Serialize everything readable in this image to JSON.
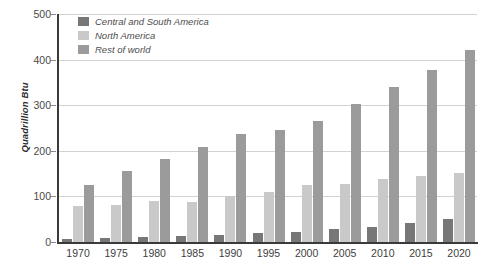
{
  "chart_data": {
    "type": "bar",
    "title": "",
    "subtitle": "",
    "xlabel": "",
    "ylabel": "Quadrillion Btu",
    "categories": [
      "1970",
      "1975",
      "1980",
      "1985",
      "1990",
      "1995",
      "2000",
      "2005",
      "2010",
      "2015",
      "2020"
    ],
    "series": [
      {
        "name": "Central and South America",
        "color": "#777777",
        "values": [
          7,
          8,
          12,
          14,
          16,
          19,
          23,
          28,
          33,
          42,
          50
        ]
      },
      {
        "name": "North America",
        "color": "#c9c9c9",
        "values": [
          78,
          81,
          89,
          88,
          101,
          110,
          126,
          128,
          139,
          145,
          152
        ]
      },
      {
        "name": "Rest of world",
        "color": "#9b9b9b",
        "values": [
          124,
          155,
          183,
          208,
          236,
          245,
          265,
          303,
          341,
          378,
          420
        ]
      }
    ],
    "ylim": [
      0,
      500
    ],
    "yticks": [
      0,
      100,
      200,
      300,
      400,
      500
    ],
    "ytick_labels": [
      "0",
      "100",
      "200",
      "300",
      "400",
      "500"
    ],
    "grid": true,
    "grid_axis": "y",
    "legend_position": "top-left",
    "bar_orientation": "vertical",
    "background_color": "#ffffff",
    "axis_color": "#3a3a3a",
    "gridline_color": "#d2d2d2"
  },
  "legend": {
    "items": [
      {
        "label": "Central and South America"
      },
      {
        "label": "North America"
      },
      {
        "label": "Rest of world"
      }
    ]
  }
}
